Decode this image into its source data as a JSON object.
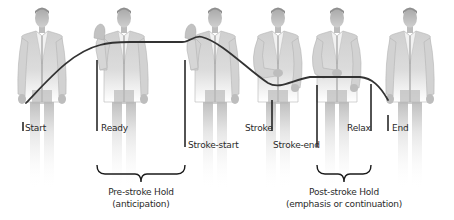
{
  "diagram": {
    "type": "gesture-phase-timeline",
    "figures": [
      {
        "id": "fig-start",
        "pose": "hands-down",
        "cx": 42
      },
      {
        "id": "fig-ready",
        "pose": "hand-raised",
        "cx": 124
      },
      {
        "id": "fig-stroke-start",
        "pose": "hand-raised",
        "cx": 215
      },
      {
        "id": "fig-stroke",
        "pose": "hand-at-waist",
        "cx": 278
      },
      {
        "id": "fig-stroke-end",
        "pose": "hand-at-waist",
        "cx": 337
      },
      {
        "id": "fig-end",
        "pose": "hands-down",
        "cx": 410
      }
    ],
    "markers": [
      {
        "label": "Start",
        "x": 23,
        "y1": 122,
        "y2": 131,
        "label_x": 25,
        "label_y": 128
      },
      {
        "label": "Ready",
        "x": 97,
        "y1": 60,
        "y2": 131,
        "label_x": 101,
        "label_y": 128
      },
      {
        "label": "Stroke-start",
        "x": 185,
        "y1": 60,
        "y2": 147,
        "label_x": 188,
        "label_y": 145
      },
      {
        "label": "Stroke",
        "x": 272,
        "y1": 100,
        "y2": 131,
        "label_x": 245,
        "label_y": 128
      },
      {
        "label": "Stroke-end",
        "x": 317,
        "y1": 85,
        "y2": 147,
        "label_x": 273,
        "label_y": 145
      },
      {
        "label": "Relax",
        "x": 371,
        "y1": 84,
        "y2": 131,
        "label_x": 347,
        "label_y": 128
      },
      {
        "label": "End",
        "x": 388,
        "y1": 115,
        "y2": 131,
        "label_x": 392,
        "label_y": 128
      }
    ],
    "braces": [
      {
        "title": "Pre-stroke Hold",
        "subtitle": "(anticipation)",
        "x1": 97,
        "x2": 185
      },
      {
        "title": "Post-stroke Hold",
        "subtitle": "(emphasis or continuation)",
        "x1": 317,
        "x2": 371
      }
    ],
    "colors": {
      "curve": "#333333",
      "marker": "#1a1a1a",
      "text": "#2a2a2a",
      "figure": "#c8c8c8"
    }
  }
}
